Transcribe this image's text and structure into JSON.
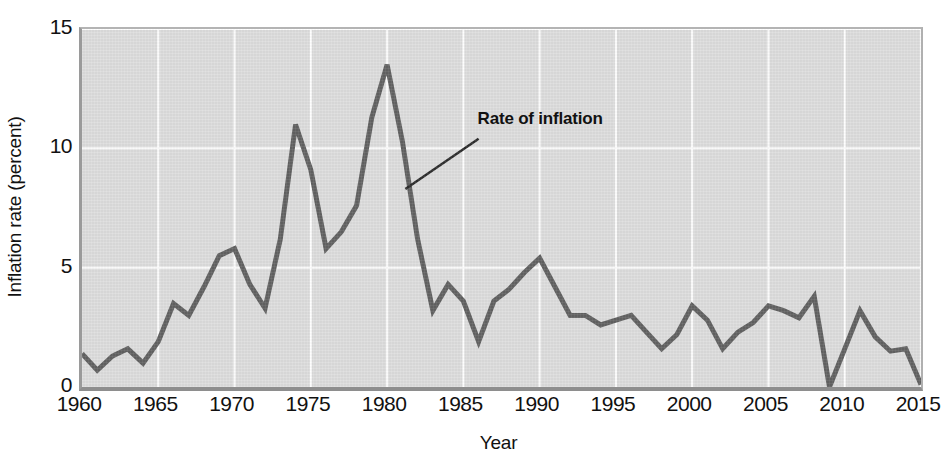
{
  "chart_data": {
    "type": "line",
    "title": "",
    "xlabel": "Year",
    "ylabel": "Inflation rate (percent)",
    "xlim": [
      1960,
      2015
    ],
    "ylim": [
      0,
      15
    ],
    "grid": true,
    "legend_position": "none",
    "xticks": [
      1960,
      1965,
      1970,
      1975,
      1980,
      1985,
      1990,
      1995,
      2000,
      2005,
      2010,
      2015
    ],
    "yticks": [
      0,
      5,
      10,
      15
    ],
    "series": [
      {
        "name": "Rate of inflation",
        "color": "#5a5a5a",
        "x": [
          1960,
          1961,
          1962,
          1963,
          1964,
          1965,
          1966,
          1967,
          1968,
          1969,
          1970,
          1971,
          1972,
          1973,
          1974,
          1975,
          1976,
          1977,
          1978,
          1979,
          1980,
          1981,
          1982,
          1983,
          1984,
          1985,
          1986,
          1987,
          1988,
          1989,
          1990,
          1991,
          1992,
          1993,
          1994,
          1995,
          1996,
          1997,
          1998,
          1999,
          2000,
          2001,
          2002,
          2003,
          2004,
          2005,
          2006,
          2007,
          2008,
          2009,
          2010,
          2011,
          2012,
          2013,
          2014,
          2015
        ],
        "y": [
          1.4,
          0.7,
          1.3,
          1.6,
          1.0,
          1.9,
          3.5,
          3.0,
          4.2,
          5.5,
          5.8,
          4.3,
          3.3,
          6.2,
          11.0,
          9.1,
          5.8,
          6.5,
          7.6,
          11.3,
          13.5,
          10.3,
          6.2,
          3.2,
          4.3,
          3.6,
          1.9,
          3.6,
          4.1,
          4.8,
          5.4,
          4.2,
          3.0,
          3.0,
          2.6,
          2.8,
          3.0,
          2.3,
          1.6,
          2.2,
          3.4,
          2.8,
          1.6,
          2.3,
          2.7,
          3.4,
          3.2,
          2.9,
          3.8,
          -0.4,
          1.6,
          3.2,
          2.1,
          1.5,
          1.6,
          0.1
        ]
      }
    ],
    "annotation": {
      "text": "Rate of inflation",
      "pointer_x": 1981.2,
      "pointer_y": 8.3,
      "label_x": 1986.0,
      "label_y": 10.4
    },
    "colors": {
      "plot_background": "#dcdcdc",
      "gridline": "#ffffff",
      "line": "#5a5a5a",
      "axis": "#8e8e8e",
      "text": "#111111"
    }
  }
}
